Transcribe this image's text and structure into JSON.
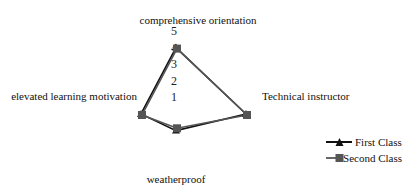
{
  "chart_data": {
    "type": "radar",
    "title": "",
    "categories": [
      "comprehensive orientation",
      "Technical instructor",
      "weatherproof",
      "elevated learning motivation"
    ],
    "series": [
      {
        "name": "First Class",
        "marker": "triangle",
        "color": "#111111",
        "values": [
          4,
          4,
          1,
          2
        ]
      },
      {
        "name": "Second Class",
        "marker": "square",
        "color": "#555555",
        "values": [
          4,
          4,
          0.8,
          2
        ]
      }
    ],
    "radial_ticks": [
      "1",
      "2",
      "3",
      "4",
      "5"
    ],
    "rlim": [
      0,
      5
    ],
    "grid": false,
    "legend_position": "bottom-right"
  },
  "legend": {
    "items": [
      {
        "label": "First Class"
      },
      {
        "label": "Second Class"
      }
    ]
  }
}
